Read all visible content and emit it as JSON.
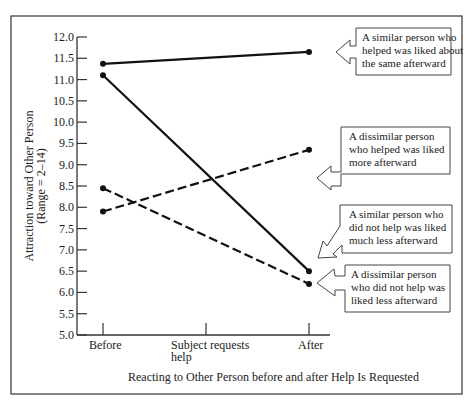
{
  "chart_data": {
    "type": "line",
    "title": "",
    "xlabel": "Reacting to Other Person before and after Help Is Requested",
    "ylabel": "Attraction toward Other Person",
    "ylabel_sub": "(Range = 2–14)",
    "ylim": [
      5.0,
      12.0
    ],
    "yticks": [
      "5.0",
      "5.5",
      "6.0",
      "6.5",
      "7.0",
      "7.5",
      "8.0",
      "8.5",
      "9.0",
      "9.5",
      "10.0",
      "10.5",
      "11.0",
      "11.5",
      "12.0"
    ],
    "categories": [
      "Before",
      "Subject requests help",
      "After"
    ],
    "x_tick_labels": [
      "Before",
      "Subject requests",
      "help",
      "After"
    ],
    "grid": false,
    "series": [
      {
        "name": "A similar person who helped was liked about the same afterward",
        "style": "solid",
        "x": [
          "Before",
          "After"
        ],
        "values": [
          11.37,
          11.65
        ]
      },
      {
        "name": "A dissimilar person who helped was liked more afterward",
        "style": "dashed",
        "x": [
          "Before",
          "After"
        ],
        "values": [
          7.9,
          9.35
        ]
      },
      {
        "name": "A similar person who did not help was liked much less afterward",
        "style": "solid",
        "x": [
          "Before",
          "After"
        ],
        "values": [
          11.1,
          6.5
        ]
      },
      {
        "name": "A dissimilar person who did not help was liked less afterward",
        "style": "dashed",
        "x": [
          "Before",
          "After"
        ],
        "values": [
          8.45,
          6.2
        ]
      }
    ],
    "annotations": [
      {
        "lines": [
          "A similar person who",
          "helped was liked about",
          "the same afterward"
        ]
      },
      {
        "lines": [
          "A dissimilar person",
          "who helped was liked",
          "more afterward"
        ]
      },
      {
        "lines": [
          "A similar person who",
          "did not help was liked",
          "much less afterward"
        ]
      },
      {
        "lines": [
          "A dissimilar person",
          "who did not help was",
          "liked less afterward"
        ]
      }
    ]
  }
}
